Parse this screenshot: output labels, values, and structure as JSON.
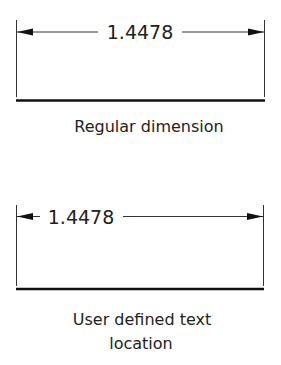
{
  "diagrams": [
    {
      "dimension_value": "1.4478",
      "caption_lines": [
        "Regular dimension"
      ]
    },
    {
      "dimension_value": "1.4478",
      "caption_lines": [
        "User defined text",
        "location"
      ]
    }
  ],
  "colors": {
    "line": "#222222",
    "background": "#ffffff"
  }
}
